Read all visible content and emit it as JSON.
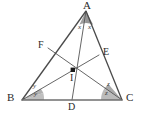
{
  "figure": {
    "kind": "geometry-diagram",
    "background_color": "#ffffff",
    "stroke_color": "#4a4a4a",
    "base_stroke_color": "#6a6a6a",
    "wedge_fill_color": "#9a9a9a",
    "wedge_fill_light": "#b8b8b8",
    "incenter_dot_color": "#1a1a1a"
  },
  "vertices": {
    "A": {
      "label": "A",
      "x": 86,
      "y": 11
    },
    "B": {
      "label": "B",
      "x": 22,
      "y": 100
    },
    "C": {
      "label": "C",
      "x": 122,
      "y": 100
    }
  },
  "points": {
    "D": {
      "label": "D",
      "x": 72,
      "y": 100
    },
    "E": {
      "label": "E",
      "x": 99,
      "y": 55
    },
    "F": {
      "label": "F",
      "x": 48,
      "y": 48
    },
    "I": {
      "label": "I",
      "x": 73,
      "y": 70
    }
  },
  "segments": [
    {
      "name": "side-AB",
      "from": "A",
      "to": "B"
    },
    {
      "name": "side-AC",
      "from": "A",
      "to": "C"
    },
    {
      "name": "side-BC",
      "from": "B",
      "to": "C"
    },
    {
      "name": "bisector-AD",
      "from": "A",
      "to": "D"
    },
    {
      "name": "bisector-BE",
      "from": "B",
      "to": "E"
    },
    {
      "name": "bisector-CF",
      "from": "C",
      "to": "F"
    }
  ],
  "angle_labels": {
    "apex_left": "x",
    "apex_right": "x",
    "base_left_upper": "y",
    "base_left_lower": "y",
    "base_right_upper": "z",
    "base_right_lower": "z"
  }
}
